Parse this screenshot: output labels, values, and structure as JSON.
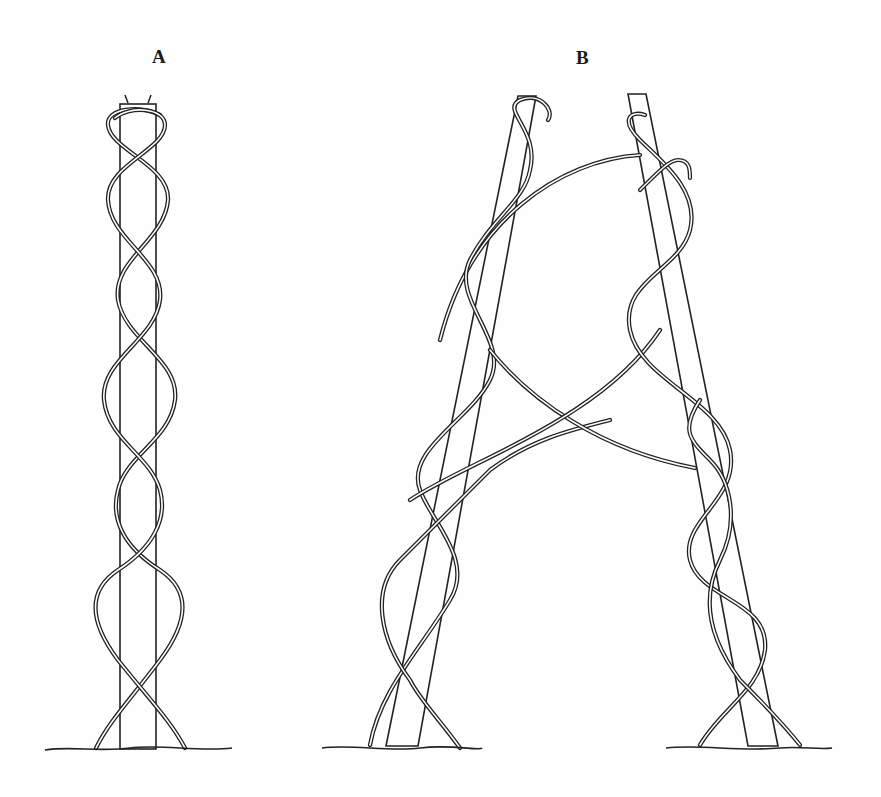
{
  "figure": {
    "panels": [
      {
        "id": "A",
        "label": "A",
        "caption_text": "A",
        "supports": 1
      },
      {
        "id": "B",
        "label": "B",
        "caption_text": "B",
        "supports": 2
      }
    ],
    "colors": {
      "ink": "#222222",
      "paper": "#fefefe"
    }
  }
}
